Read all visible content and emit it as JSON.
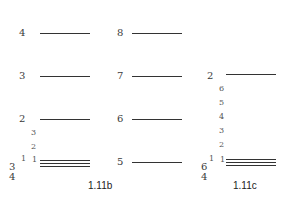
{
  "diagram": {
    "type": "energy-level diagrams",
    "panel_b": {
      "caption": "1.11b",
      "left_levels": [
        {
          "label": "4"
        },
        {
          "label": "3"
        },
        {
          "label": "2"
        }
      ],
      "right_levels": [
        {
          "label": "8"
        },
        {
          "label": "7"
        },
        {
          "label": "6"
        },
        {
          "label": "5"
        }
      ],
      "stack_labels": [
        "3",
        "2"
      ],
      "ground_labels": {
        "left_top": "1",
        "left_mid": "1",
        "sub_a": "3",
        "sub_b": "4"
      }
    },
    "panel_c": {
      "caption": "1.11c",
      "top_level": {
        "label": "2"
      },
      "stack_labels": [
        "6",
        "5",
        "4",
        "3",
        "2"
      ],
      "ground_labels": {
        "left_top": "1",
        "left_mid": "1",
        "sub_a": "6",
        "sub_b": "4"
      }
    }
  }
}
